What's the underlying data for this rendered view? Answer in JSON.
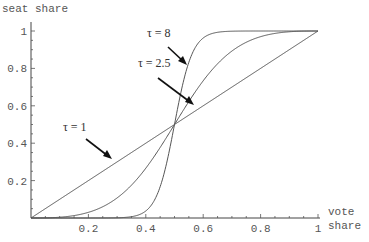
{
  "chart_data": {
    "type": "line",
    "title": "",
    "xlabel": "vote share",
    "ylabel": "seat share",
    "xlabel_lines": [
      "vote",
      "share"
    ],
    "xlim": [
      0,
      1
    ],
    "ylim": [
      0,
      1
    ],
    "grid": false,
    "legend": "none (inline arrow annotations)",
    "x_ticks": [
      "0.2",
      "0.4",
      "0.6",
      "0.8",
      "1"
    ],
    "y_ticks": [
      "0.2",
      "0.4",
      "0.6",
      "0.8",
      "1"
    ],
    "formula": "s = v^tau / (v^tau + (1-v)^tau)",
    "series": [
      {
        "name": "τ = 1",
        "tau": 1,
        "x": [
          0,
          0.1,
          0.2,
          0.3,
          0.4,
          0.5,
          0.6,
          0.7,
          0.8,
          0.9,
          1
        ],
        "values": [
          0,
          0.1,
          0.2,
          0.3,
          0.4,
          0.5,
          0.6,
          0.7,
          0.8,
          0.9,
          1
        ]
      },
      {
        "name": "τ = 2.5",
        "tau": 2.5,
        "x": [
          0,
          0.1,
          0.2,
          0.3,
          0.4,
          0.5,
          0.6,
          0.7,
          0.8,
          0.9,
          1
        ],
        "values": [
          0,
          0.004,
          0.03,
          0.11,
          0.27,
          0.5,
          0.73,
          0.89,
          0.97,
          0.996,
          1
        ]
      },
      {
        "name": "τ = 8",
        "tau": 8,
        "x": [
          0,
          0.1,
          0.2,
          0.3,
          0.4,
          0.5,
          0.6,
          0.7,
          0.8,
          0.9,
          1
        ],
        "values": [
          0,
          0.0,
          0.0,
          0.001,
          0.038,
          0.5,
          0.962,
          0.999,
          1.0,
          1.0,
          1
        ]
      }
    ],
    "annotations": [
      {
        "text": "τ = 8",
        "label_x": 147,
        "label_y": 37,
        "arrow_from": [
          168,
          47
        ],
        "arrow_to": [
          186,
          64
        ]
      },
      {
        "text": "τ = 2.5",
        "label_x": 138,
        "label_y": 67,
        "arrow_from": [
          158,
          78
        ],
        "arrow_to": [
          193,
          104
        ]
      },
      {
        "text": "τ = 1",
        "label_x": 63,
        "label_y": 131,
        "arrow_from": [
          86,
          139
        ],
        "arrow_to": [
          111,
          158
        ]
      }
    ]
  },
  "labels": {
    "ylabel": "seat share",
    "xlabel_line1": "vote",
    "xlabel_line2": "share",
    "ann_tau8": "τ = 8",
    "ann_tau25": "τ = 2.5",
    "ann_tau1": "τ = 1"
  }
}
